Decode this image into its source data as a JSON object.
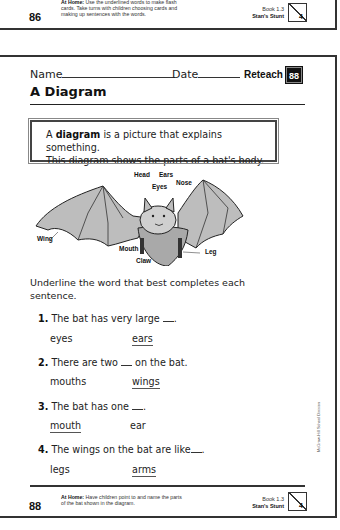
{
  "previous_page": {
    "page_number": "86",
    "at_home_label": "At Home:",
    "at_home_text": "Use the underlined words to make flash cards. Take turns with children choosing cards and making up sentences with the words.",
    "book": "Book 1.3",
    "story": "Stan's Stunt",
    "unit": "4"
  },
  "header": {
    "name_label": "Name",
    "date_label": "Date",
    "reteach_label": "Reteach",
    "page_badge": "88"
  },
  "title": "A Diagram",
  "definition": {
    "prefix": "A ",
    "term": "diagram",
    "line1_rest": " is a picture that explains something.",
    "line2": "This diagram shows the parts of a bat's body."
  },
  "diagram": {
    "subject": "bat",
    "labels": {
      "head": "Head",
      "ears": "Ears",
      "eyes": "Eyes",
      "nose": "Nose",
      "wing": "Wing",
      "mouth": "Mouth",
      "claw": "Claw",
      "leg": "Leg"
    }
  },
  "instructions": "Underline the word that best completes each sentence.",
  "questions": [
    {
      "number": "1.",
      "text_before": "The bat has very large ",
      "text_after": ".",
      "options": [
        {
          "word": "eyes",
          "underlined": false
        },
        {
          "word": "ears",
          "underlined": true
        }
      ]
    },
    {
      "number": "2.",
      "text_before": "There are two ",
      "text_after": " on the bat.",
      "options": [
        {
          "word": "mouths",
          "underlined": false
        },
        {
          "word": "wings",
          "underlined": true
        }
      ]
    },
    {
      "number": "3.",
      "text_before": "The bat has one ",
      "text_after": ".",
      "options": [
        {
          "word": "mouth",
          "underlined": true
        },
        {
          "word": "ear",
          "underlined": false
        }
      ]
    },
    {
      "number": "4.",
      "text_before": "The wings on the bat are like",
      "text_after": ".",
      "options": [
        {
          "word": "legs",
          "underlined": false
        },
        {
          "word": "arms",
          "underlined": true
        }
      ]
    }
  ],
  "side_credit": "McGraw-Hill School Division",
  "footer": {
    "page_number": "88",
    "at_home_label": "At Home:",
    "at_home_text": "Have children point to and name the parts of the bat shown in the diagram.",
    "book": "Book 1.3",
    "story": "Stan's Stunt",
    "unit": "4"
  }
}
